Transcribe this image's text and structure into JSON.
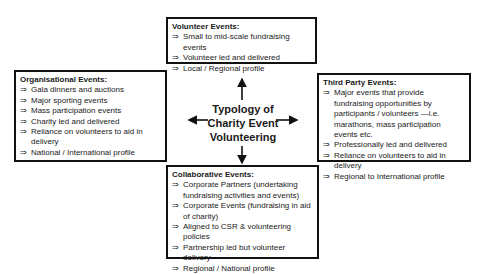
{
  "diagram": {
    "center_label": [
      "Typology of",
      "Charity Event",
      "Volunteering"
    ],
    "bullet_symbol": "⇒",
    "boxes": {
      "volunteer": {
        "title": "Volunteer Events:",
        "items": [
          "Small to mid-scale fundraising events",
          "Volunteer led and delivered",
          "Local / Regional profile"
        ]
      },
      "organisational": {
        "title": "Organisational Events:",
        "items": [
          "Gala dinners and auctions",
          "Major sporting events",
          "Mass participation events",
          "Charity led and delivered",
          "Reliance on volunteers to aid in delivery",
          "National / International profile"
        ]
      },
      "third_party": {
        "title": "Third Party Events:",
        "items": [
          "Major  events that provide fundraising opportunities by participants / volunteers —i.e. marathons, mass participation events etc.",
          "Professionally led and delivered",
          "Reliance on volunteers to aid in delivery",
          "Regional to International profile"
        ]
      },
      "collaborative": {
        "title": "Collaborative Events:",
        "items": [
          "Corporate Partners (undertaking fundraising activities and events)",
          "Corporate Events (fundraising in aid of charity)",
          "Aligned to CSR & volunteering policies",
          "Partnership led but volunteer delivery",
          "Regional / National profile"
        ]
      }
    },
    "colors": {
      "border": "#111111",
      "text": "#1a1a1a",
      "background": "#ffffff"
    }
  }
}
